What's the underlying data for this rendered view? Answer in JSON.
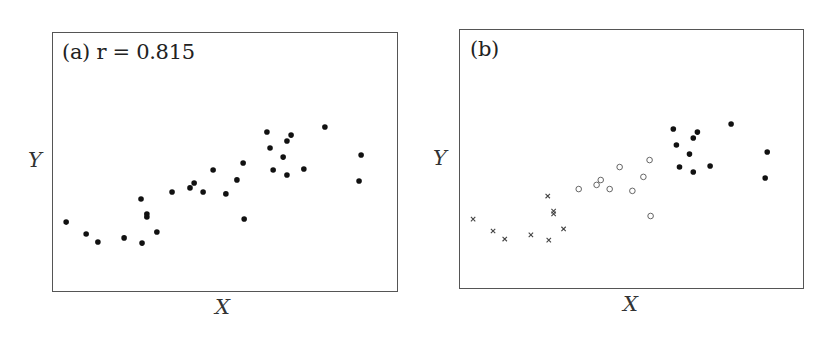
{
  "chart_data": [
    {
      "type": "scatter",
      "title": "(a) r = 0.815",
      "panel_label": "(a)",
      "annotation": "r = 0.815",
      "xlabel": "X",
      "ylabel": "Y",
      "xlim": [
        0,
        100
      ],
      "ylim": [
        0,
        100
      ],
      "grid": false,
      "legend": null,
      "ticks": "none",
      "series": [
        {
          "name": "all points",
          "marker": "filled-circle",
          "color": "#111111",
          "points": [
            [
              4.1,
              26.6
            ],
            [
              9.9,
              22.0
            ],
            [
              13.3,
              18.9
            ],
            [
              20.9,
              20.5
            ],
            [
              26.1,
              18.5
            ],
            [
              25.8,
              35.5
            ],
            [
              27.5,
              29.7
            ],
            [
              27.5,
              28.6
            ],
            [
              30.4,
              22.8
            ],
            [
              34.8,
              38.2
            ],
            [
              40.0,
              39.8
            ],
            [
              41.2,
              41.7
            ],
            [
              43.8,
              38.2
            ],
            [
              46.7,
              46.7
            ],
            [
              50.4,
              37.5
            ],
            [
              53.6,
              42.9
            ],
            [
              55.4,
              49.4
            ],
            [
              55.7,
              27.8
            ],
            [
              62.3,
              61.4
            ],
            [
              63.2,
              55.2
            ],
            [
              68.1,
              57.9
            ],
            [
              69.3,
              60.2
            ],
            [
              67.0,
              51.7
            ],
            [
              64.1,
              46.7
            ],
            [
              68.1,
              44.8
            ],
            [
              73.0,
              47.1
            ],
            [
              79.1,
              63.3
            ],
            [
              89.6,
              52.5
            ],
            [
              89.0,
              42.5
            ]
          ]
        }
      ]
    },
    {
      "type": "scatter",
      "title": "(b)",
      "panel_label": "(b)",
      "xlabel": "X",
      "ylabel": "Y",
      "xlim": [
        0,
        100
      ],
      "ylim": [
        0,
        100
      ],
      "grid": false,
      "legend": null,
      "ticks": "none",
      "series": [
        {
          "name": "low group",
          "marker": "x",
          "color": "#444444",
          "points": [
            [
              4.1,
              26.6
            ],
            [
              9.9,
              22.0
            ],
            [
              13.3,
              18.9
            ],
            [
              20.9,
              20.5
            ],
            [
              26.1,
              18.5
            ],
            [
              25.8,
              35.5
            ],
            [
              27.5,
              29.7
            ],
            [
              27.5,
              28.6
            ],
            [
              30.4,
              22.8
            ]
          ]
        },
        {
          "name": "middle group",
          "marker": "open-circle",
          "color": "#666666",
          "points": [
            [
              34.8,
              38.2
            ],
            [
              40.0,
              39.8
            ],
            [
              41.2,
              41.7
            ],
            [
              43.8,
              38.2
            ],
            [
              46.7,
              46.7
            ],
            [
              50.4,
              37.5
            ],
            [
              53.6,
              42.9
            ],
            [
              55.4,
              49.4
            ],
            [
              55.7,
              27.8
            ]
          ]
        },
        {
          "name": "high group",
          "marker": "filled-circle",
          "color": "#111111",
          "points": [
            [
              62.3,
              61.4
            ],
            [
              63.2,
              55.2
            ],
            [
              68.1,
              57.9
            ],
            [
              69.3,
              60.2
            ],
            [
              67.0,
              51.7
            ],
            [
              64.1,
              46.7
            ],
            [
              68.1,
              44.8
            ],
            [
              73.0,
              47.1
            ],
            [
              79.1,
              63.3
            ],
            [
              89.6,
              52.5
            ],
            [
              89.0,
              42.5
            ]
          ]
        }
      ]
    }
  ],
  "panels": {
    "a": {
      "label": "(a)  r = 0.815",
      "xlabel": "X",
      "ylabel": "Y"
    },
    "b": {
      "label": "(b)",
      "xlabel": "X",
      "ylabel": "Y"
    }
  },
  "colors": {
    "frame": "#555555",
    "point": "#111111",
    "x_marker": "#444444",
    "open_circle": "#666666"
  }
}
